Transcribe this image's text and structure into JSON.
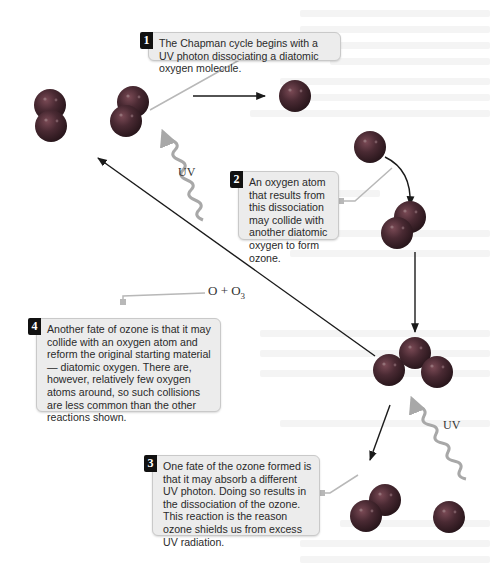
{
  "diagram": {
    "title": "Chapman cycle",
    "colors": {
      "atom": "#4a2a33",
      "atom_highlight": "#7a4a55",
      "arrow": "#1a1a1a",
      "uv_wave": "#a8a8a8",
      "connector": "#b8b8b8",
      "callout_bg": "#ececec",
      "badge_bg": "#111111"
    },
    "callouts": [
      {
        "number": "1",
        "text": "The Chapman cycle begins with a UV photon dissociating a diatomic oxygen molecule."
      },
      {
        "number": "2",
        "text": "An oxygen atom that results from this dissociation may collide with another diatomic oxygen to form ozone."
      },
      {
        "number": "3",
        "text": "One fate of the ozone formed is that it may absorb a different UV photon. Doing so results in the dissociation of the ozone. This reaction is the reason ozone shields us from excess UV radiation."
      },
      {
        "number": "4",
        "text": "Another fate of ozone is that it may collide with an oxygen atom and reform the original starting material — diatomic oxygen. There are, however, relatively few oxygen atoms around, so such collisions are less common than the other reactions shown."
      }
    ],
    "labels": {
      "uv_top": "UV",
      "uv_bottom": "UV",
      "equation_o": "O + O",
      "equation_sub": "3"
    },
    "molecules": [
      {
        "id": "o2-start",
        "type": "O2"
      },
      {
        "id": "o2-dissociating",
        "type": "O2"
      },
      {
        "id": "o-atom-top",
        "type": "O"
      },
      {
        "id": "o-atom-right",
        "type": "O"
      },
      {
        "id": "o2-colliding",
        "type": "O2"
      },
      {
        "id": "o3-ozone",
        "type": "O3"
      },
      {
        "id": "o2-product",
        "type": "O2"
      },
      {
        "id": "o-atom-product",
        "type": "O"
      }
    ]
  }
}
